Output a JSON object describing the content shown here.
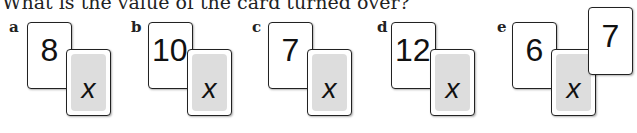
{
  "question": "What is the value of the card turned over?",
  "items": [
    {
      "label": "a",
      "front": "8",
      "hidden": "x"
    },
    {
      "label": "b",
      "front": "10",
      "hidden": "x"
    },
    {
      "label": "c",
      "front": "7",
      "hidden": "x"
    },
    {
      "label": "d",
      "front": "12",
      "hidden": "x"
    },
    {
      "label": "e",
      "front": "6",
      "hidden": "x",
      "extra": "7"
    }
  ]
}
